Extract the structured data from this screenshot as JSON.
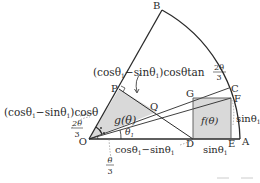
{
  "diagram": {
    "colors": {
      "stroke": "#2a2a2a",
      "fill": "#d9d9d9",
      "thin": "#555555"
    },
    "points": {
      "O": {
        "label": "O",
        "x": 89,
        "y": 139
      },
      "A": {
        "label": "A",
        "x": 240,
        "y": 139
      },
      "B": {
        "label": "B",
        "x": 162,
        "y": 10
      },
      "C": {
        "label": "C",
        "x": 229,
        "y": 88
      },
      "D": {
        "label": "D",
        "x": 193,
        "y": 139
      },
      "E": {
        "label": "E",
        "x": 231,
        "y": 139
      },
      "F": {
        "label": "F",
        "x": 231,
        "y": 98
      },
      "G": {
        "label": "G",
        "x": 193,
        "y": 98
      },
      "P": {
        "label": "P",
        "x": 119,
        "y": 89
      },
      "Q": {
        "label": "Q",
        "x": 157,
        "y": 112
      }
    },
    "regions": {
      "f": "f(θ)",
      "g": "g(θ)"
    },
    "annotations": {
      "top_formula": "(cosθ",
      "top_formula_sub": "1",
      "top_formula_mid": "−sinθ",
      "top_formula_sub2": "1",
      "top_formula_end": ")cosθtan",
      "two_theta_num": "2θ",
      "frac_den": "3",
      "left_formula": "(cosθ",
      "left_formula_sub": "1",
      "left_formula_mid": "−sinθ",
      "left_formula_sub2": "1",
      "left_formula_end": ")cosθ",
      "angle_2theta_num": "2θ",
      "angle_2theta_den": "3",
      "angle_theta_num": "θ",
      "angle_theta_den": "3",
      "theta1": "θ",
      "theta1_sub": "1",
      "bottom_od": "cosθ",
      "bottom_od_sub": "1",
      "bottom_od_mid": "−sinθ",
      "bottom_od_sub2": "1",
      "bottom_de": "sinθ",
      "bottom_de_sub": "1",
      "right_ef": "sinθ",
      "right_ef_sub": "1"
    }
  }
}
